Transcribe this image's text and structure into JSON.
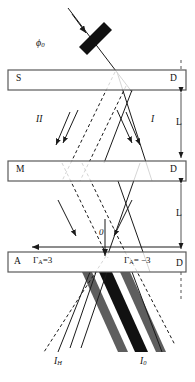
{
  "figure": {
    "name": "neutron-interferometer-schematic",
    "background_color": "#ffffff",
    "line_color": "#1a1a1a",
    "slab_fill": "#ffffff",
    "band_gray": "#5e5e5e",
    "band_black": "#111111"
  },
  "labels": {
    "phase_flag": "ϕ",
    "phase_flag_sub": "0",
    "slab_s": "S",
    "slab_d_top": "D",
    "slab_m": "M",
    "slab_d_mid": "D",
    "slab_a": "A",
    "slab_d_bot": "D",
    "beam_path_I": "I",
    "beam_path_II": "II",
    "length_top": "L",
    "length_bottom": "L",
    "gamma_left": "Γ",
    "gamma_left_sub": "A",
    "gamma_left_value": "=3",
    "gamma_right": "Γ",
    "gamma_right_sub": "A",
    "gamma_right_value": "= −3",
    "origin": "0",
    "out_IH": "I",
    "out_IH_sub": "H",
    "out_I0": "I",
    "out_I0_sub": "0"
  },
  "elements": {
    "slabs": [
      {
        "name": "slab-s-d",
        "x": 8,
        "y": 70,
        "w": 178,
        "h": 20
      },
      {
        "name": "slab-m-d",
        "x": 8,
        "y": 161,
        "w": 178,
        "h": 20
      },
      {
        "name": "slab-a-d",
        "x": 8,
        "y": 252,
        "w": 178,
        "h": 20
      }
    ],
    "phase_flag": {
      "name": "phase-flag-plate",
      "angle_deg": -45
    },
    "dimension_arrows": [
      {
        "name": "length-arrow-top",
        "value": "L"
      },
      {
        "name": "length-arrow-bottom",
        "value": "L"
      }
    ],
    "fringe_bands": [
      {
        "name": "fringe-band-gray-left",
        "color": "#5e5e5e"
      },
      {
        "name": "fringe-band-black-center",
        "color": "#111111"
      },
      {
        "name": "fringe-band-gray-right",
        "color": "#5e5e5e"
      }
    ]
  }
}
